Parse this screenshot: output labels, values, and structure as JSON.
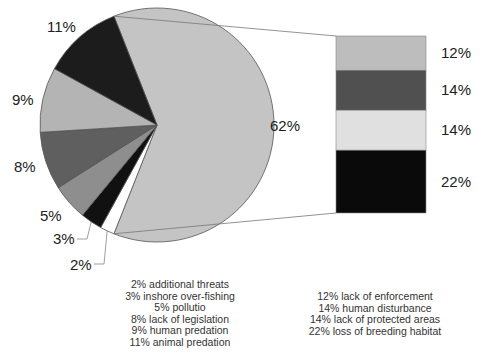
{
  "chart_data": {
    "type": "pie",
    "title": "",
    "pie": {
      "slices": [
        {
          "label": "62%",
          "value": 62,
          "color": "#c4c4c4",
          "name": "other-threats"
        },
        {
          "label": "2%",
          "value": 2,
          "color": "#ffffff",
          "name": "additional-threats"
        },
        {
          "label": "3%",
          "value": 3,
          "color": "#111111",
          "name": "inshore-over-fishing"
        },
        {
          "label": "5%",
          "value": 5,
          "color": "#8e8e8e",
          "name": "pollutio"
        },
        {
          "label": "8%",
          "value": 8,
          "color": "#5f5f5f",
          "name": "lack-of-legislation"
        },
        {
          "label": "9%",
          "value": 9,
          "color": "#b4b4b4",
          "name": "human-predation"
        },
        {
          "label": "11%",
          "value": 11,
          "color": "#1c1c1c",
          "name": "animal-predation"
        }
      ]
    },
    "bar": {
      "segments": [
        {
          "label": "12%",
          "value": 12,
          "color": "#bdbdbd",
          "name": "lack-of-enforcement"
        },
        {
          "label": "14%",
          "value": 14,
          "color": "#505050",
          "name": "human-disturbance"
        },
        {
          "label": "14%",
          "value": 14,
          "color": "#e0e0e0",
          "name": "lack-of-protected-areas"
        },
        {
          "label": "22%",
          "value": 22,
          "color": "#0a0a0a",
          "name": "loss-of-breeding-habitat"
        }
      ]
    },
    "legend_left": [
      "2% additional threats",
      "3% inshore over-fishing",
      "5% pollutio",
      "8% lack of legislation",
      "9% human predation",
      "11% animal predation"
    ],
    "legend_right": [
      "12% lack of enforcement",
      "14% human disturbance",
      "14% lack of protected areas",
      "22% loss of breeding habitat"
    ]
  }
}
